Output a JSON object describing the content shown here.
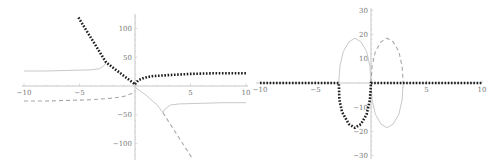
{
  "chart_data": [
    {
      "type": "line",
      "panel": "left",
      "title": "",
      "xlabel": "",
      "ylabel": "",
      "xlim": [
        -10,
        10
      ],
      "ylim": [
        -125,
        125
      ],
      "grid": false,
      "legend": null,
      "x_ticks": [
        -10,
        -5,
        5,
        10
      ],
      "x_tick_labels": [
        "-10",
        "-5",
        "5",
        "10"
      ],
      "y_ticks": [
        100,
        50,
        -50,
        -100
      ],
      "y_tick_labels": [
        "100",
        "50",
        "-50",
        "-100"
      ],
      "series": [
        {
          "name": "solid",
          "style": "solid",
          "color": "#c9c9c9",
          "segments": [
            [
              [
                -10,
                26
              ],
              [
                -8,
                26
              ],
              [
                -6,
                27
              ],
              [
                -4,
                28
              ],
              [
                -3.2,
                30
              ],
              [
                -2.8,
                35
              ],
              [
                -2.6,
                41
              ]
            ],
            [
              [
                0,
                -2
              ],
              [
                1,
                -16
              ],
              [
                2,
                -33
              ],
              [
                2.5,
                -46
              ],
              [
                2.7,
                -40
              ],
              [
                3.2,
                -33
              ],
              [
                4,
                -31
              ],
              [
                6,
                -30
              ],
              [
                8,
                -29
              ],
              [
                10,
                -29
              ]
            ]
          ]
        },
        {
          "name": "dashed",
          "style": "dashed",
          "color": "#a8a8a8",
          "segments": [
            [
              [
                -10,
                -26
              ],
              [
                -8,
                -26
              ],
              [
                -6,
                -25
              ],
              [
                -4,
                -24
              ],
              [
                -2,
                -21
              ],
              [
                -1,
                -18
              ],
              [
                -0.3,
                -13
              ],
              [
                0,
                -8
              ]
            ],
            [
              [
                2.5,
                -46
              ],
              [
                5.1,
                -124
              ]
            ]
          ]
        },
        {
          "name": "dotted",
          "style": "dotted",
          "color": "#1e1e1e",
          "segments": [
            [
              [
                -5.1,
                119
              ],
              [
                -2.6,
                41
              ],
              [
                0,
                3
              ]
            ],
            [
              [
                0,
                3
              ],
              [
                0.3,
                10
              ],
              [
                0.8,
                14
              ],
              [
                1.5,
                17
              ],
              [
                3,
                19
              ],
              [
                5,
                21
              ],
              [
                7,
                22
              ],
              [
                10,
                22
              ]
            ]
          ]
        }
      ]
    },
    {
      "type": "line",
      "panel": "right",
      "title": "",
      "xlabel": "",
      "ylabel": "",
      "xlim": [
        -10,
        10
      ],
      "ylim": [
        -31,
        31
      ],
      "grid": false,
      "legend": null,
      "x_ticks": [
        -10,
        -5,
        5,
        10
      ],
      "x_tick_labels": [
        "-10",
        "-5",
        "5",
        "10"
      ],
      "y_ticks": [
        30,
        20,
        10,
        -10,
        -20,
        -30
      ],
      "y_tick_labels": [
        "30",
        "20",
        "10",
        "-10",
        "-20",
        "-30"
      ],
      "series": [
        {
          "name": "solid",
          "style": "solid",
          "color": "#c9c9c9",
          "segments": [
            [
              [
                -2.9,
                0
              ],
              [
                -2.8,
                7
              ],
              [
                -2.5,
                13
              ],
              [
                -2,
                17
              ],
              [
                -1.45,
                18.5
              ],
              [
                -0.9,
                17
              ],
              [
                -0.4,
                13
              ],
              [
                -0.1,
                7
              ],
              [
                0,
                0
              ]
            ],
            [
              [
                0,
                0
              ],
              [
                0.1,
                -7
              ],
              [
                0.4,
                -13
              ],
              [
                0.9,
                -17
              ],
              [
                1.45,
                -18.5
              ],
              [
                2,
                -17
              ],
              [
                2.5,
                -13
              ],
              [
                2.8,
                -7
              ],
              [
                2.9,
                0
              ]
            ]
          ]
        },
        {
          "name": "dashed",
          "style": "dashed",
          "color": "#a8a8a8",
          "segments": [
            [
              [
                0,
                0
              ],
              [
                0.1,
                7
              ],
              [
                0.4,
                13
              ],
              [
                0.9,
                17
              ],
              [
                1.45,
                18.5
              ],
              [
                2,
                17
              ],
              [
                2.5,
                13
              ],
              [
                2.8,
                7
              ],
              [
                2.9,
                0
              ]
            ]
          ]
        },
        {
          "name": "dotted",
          "style": "dotted",
          "color": "#1e1e1e",
          "segments": [
            [
              [
                -10,
                0
              ],
              [
                -2.9,
                0
              ],
              [
                -2.85,
                -7
              ],
              [
                -2.6,
                -12
              ],
              [
                -2,
                -17
              ],
              [
                -1.45,
                -18.5
              ],
              [
                -0.9,
                -17
              ],
              [
                -0.4,
                -13
              ],
              [
                -0.1,
                -7
              ],
              [
                0,
                0
              ],
              [
                10,
                0
              ]
            ]
          ]
        }
      ]
    }
  ]
}
